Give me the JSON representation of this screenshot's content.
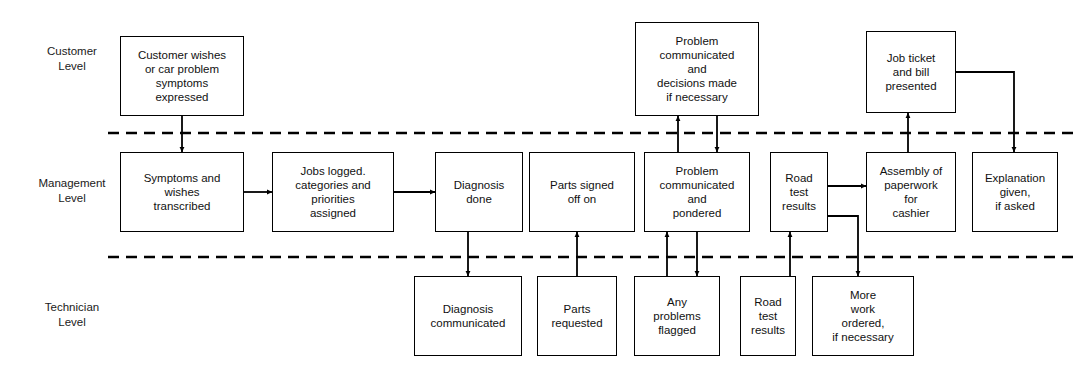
{
  "diagram": {
    "colors": {
      "box_stroke": "#000000",
      "box_fill": "#ffffff",
      "connector": "#000000",
      "lane_divider": "#000000",
      "text": "#111111",
      "background": "#ffffff"
    },
    "lanes": [
      {
        "id": "customer",
        "label": "Customer\nLevel",
        "x": 26,
        "y": 44,
        "w": 92
      },
      {
        "id": "management",
        "label": "Management\nLevel",
        "x": 19,
        "y": 176,
        "w": 106
      },
      {
        "id": "technician",
        "label": "Technician\nLevel",
        "x": 24,
        "y": 300,
        "w": 96
      }
    ],
    "dividers": [
      {
        "id": "customer-management-divider",
        "y": 133,
        "x1": 108,
        "x2": 1076
      },
      {
        "id": "management-technician-divider",
        "y": 257,
        "x1": 108,
        "x2": 1076
      }
    ],
    "nodes": [
      {
        "id": "customer-wishes",
        "lane": "customer",
        "label": "Customer wishes\nor car problem\nsymptoms\nexpressed",
        "x": 120,
        "y": 36,
        "w": 124,
        "h": 80
      },
      {
        "id": "problem-decisions",
        "lane": "customer",
        "label": "Problem\ncommunicated\nand\ndecisions made\nif necessary",
        "x": 635,
        "y": 22,
        "w": 124,
        "h": 94
      },
      {
        "id": "job-ticket-bill",
        "lane": "customer",
        "label": "Job ticket\nand bill\npresented",
        "x": 866,
        "y": 31,
        "w": 90,
        "h": 82
      },
      {
        "id": "symptoms-transcribed",
        "lane": "management",
        "label": "Symptoms and\nwishes\ntranscribed",
        "x": 120,
        "y": 152,
        "w": 124,
        "h": 80
      },
      {
        "id": "jobs-logged",
        "lane": "management",
        "label": "Jobs logged.\ncategories and\npriorities\nassigned",
        "x": 272,
        "y": 152,
        "w": 122,
        "h": 80
      },
      {
        "id": "diagnosis-done",
        "lane": "management",
        "label": "Diagnosis\ndone",
        "x": 435,
        "y": 152,
        "w": 88,
        "h": 80
      },
      {
        "id": "parts-signed-off",
        "lane": "management",
        "label": "Parts signed\noff on",
        "x": 529,
        "y": 152,
        "w": 106,
        "h": 80
      },
      {
        "id": "problem-pondered",
        "lane": "management",
        "label": "Problem\ncommunicated\nand\npondered",
        "x": 644,
        "y": 152,
        "w": 106,
        "h": 80
      },
      {
        "id": "road-test-results-mgmt",
        "lane": "management",
        "label": "Road\ntest\nresults",
        "x": 770,
        "y": 152,
        "w": 58,
        "h": 80
      },
      {
        "id": "assembly-paperwork",
        "lane": "management",
        "label": "Assembly of\npaperwork\nfor\ncashier",
        "x": 866,
        "y": 152,
        "w": 90,
        "h": 80
      },
      {
        "id": "explanation-given",
        "lane": "management",
        "label": "Explanation\ngiven,\nif asked",
        "x": 972,
        "y": 152,
        "w": 86,
        "h": 80
      },
      {
        "id": "diagnosis-communicated",
        "lane": "technician",
        "label": "Diagnosis\ncommunicated",
        "x": 414,
        "y": 276,
        "w": 108,
        "h": 80
      },
      {
        "id": "parts-requested",
        "lane": "technician",
        "label": "Parts\nrequested",
        "x": 537,
        "y": 276,
        "w": 80,
        "h": 80
      },
      {
        "id": "any-problems-flagged",
        "lane": "technician",
        "label": "Any\nproblems\nflagged",
        "x": 634,
        "y": 276,
        "w": 86,
        "h": 80
      },
      {
        "id": "road-test-results-tech",
        "lane": "technician",
        "label": "Road\ntest\nresults",
        "x": 740,
        "y": 276,
        "w": 56,
        "h": 80
      },
      {
        "id": "more-work-ordered",
        "lane": "technician",
        "label": "More\nwork\nordered,\nif necessary",
        "x": 812,
        "y": 276,
        "w": 102,
        "h": 80
      }
    ],
    "connectors": [
      {
        "id": "conn-customer-to-symptoms",
        "from": "customer-wishes",
        "to": "symptoms-transcribed",
        "points": "182,116 182,152",
        "arrow": "end"
      },
      {
        "id": "conn-symptoms-to-jobs",
        "from": "symptoms-transcribed",
        "to": "jobs-logged",
        "points": "244,192 272,192",
        "arrow": "end"
      },
      {
        "id": "conn-jobs-to-diagnosis",
        "from": "jobs-logged",
        "to": "diagnosis-done",
        "points": "394,192 435,192",
        "arrow": "end"
      },
      {
        "id": "conn-diagnosis-to-communicated",
        "from": "diagnosis-done",
        "to": "diagnosis-communicated",
        "points": "468,232 468,276",
        "arrow": "end"
      },
      {
        "id": "conn-parts-requested-to-signed",
        "from": "parts-requested",
        "to": "parts-signed-off",
        "points": "577,276 577,232",
        "arrow": "end"
      },
      {
        "id": "conn-problems-flagged-to-pondered",
        "from": "any-problems-flagged",
        "to": "problem-pondered",
        "points": "667,276 667,232",
        "arrow": "end"
      },
      {
        "id": "conn-pondered-to-flagged",
        "from": "problem-pondered",
        "to": "any-problems-flagged",
        "points": "697,232 697,276",
        "arrow": "end"
      },
      {
        "id": "conn-pondered-to-decisions",
        "from": "problem-pondered",
        "to": "problem-decisions",
        "points": "678,152 678,116",
        "arrow": "end"
      },
      {
        "id": "conn-decisions-to-pondered",
        "from": "problem-decisions",
        "to": "problem-pondered",
        "points": "717,116 717,152",
        "arrow": "end"
      },
      {
        "id": "conn-roadtest-tech-to-mgmt",
        "from": "road-test-results-tech",
        "to": "road-test-results-mgmt",
        "points": "790,276 790,232",
        "arrow": "end"
      },
      {
        "id": "conn-roadtest-to-assembly",
        "from": "road-test-results-mgmt",
        "to": "assembly-paperwork",
        "points": "828,186 866,186",
        "arrow": "end"
      },
      {
        "id": "conn-roadtest-to-more-work",
        "from": "road-test-results-mgmt",
        "to": "more-work-ordered",
        "points": "828,216 858,216 858,276",
        "arrow": "end"
      },
      {
        "id": "conn-assembly-to-job-ticket",
        "from": "assembly-paperwork",
        "to": "job-ticket-bill",
        "points": "908,152 908,113",
        "arrow": "end"
      },
      {
        "id": "conn-job-ticket-to-explanation",
        "from": "job-ticket-bill",
        "to": "explanation-given",
        "points": "956,72 1014,72 1014,152",
        "arrow": "end"
      }
    ]
  }
}
